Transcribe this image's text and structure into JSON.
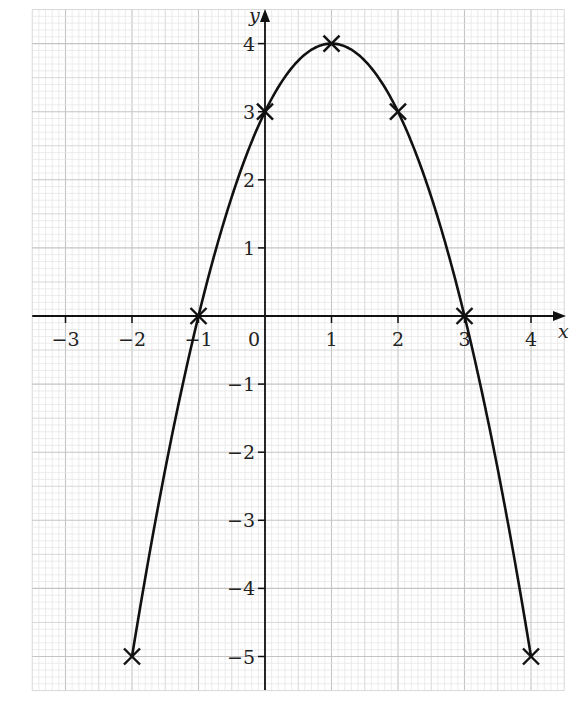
{
  "chart_data": {
    "type": "line",
    "title": "",
    "xlabel": "x",
    "ylabel": "y",
    "function": "y = -x^2 + 2x + 3",
    "series": [
      {
        "name": "curve",
        "x": [
          -2,
          -1,
          0,
          1,
          2,
          3,
          4
        ],
        "values": [
          -5,
          0,
          3,
          4,
          3,
          0,
          -5
        ],
        "markers": "cross"
      }
    ],
    "x_ticks": [
      -3,
      -2,
      -1,
      0,
      1,
      2,
      3,
      4
    ],
    "x_tick_labels": [
      "−3",
      "−2",
      "−1",
      "0",
      "1",
      "2",
      "3",
      "4"
    ],
    "y_ticks": [
      4,
      3,
      2,
      1,
      -1,
      -2,
      -3,
      -4,
      -5
    ],
    "y_tick_labels": [
      "4",
      "3",
      "2",
      "1",
      "−1",
      "−2",
      "−3",
      "−4",
      "−5"
    ],
    "xlim": [
      -3.5,
      4.5
    ],
    "ylim": [
      -5.5,
      4.5
    ],
    "grid": true,
    "grid_minor_divisions": 10,
    "legend": "none",
    "colors": {
      "curve": "#111111",
      "axis": "#111111",
      "grid_minor": "#e4e4e4",
      "grid_half": "#d4d4d4",
      "grid_major": "#c4c4c4"
    }
  }
}
